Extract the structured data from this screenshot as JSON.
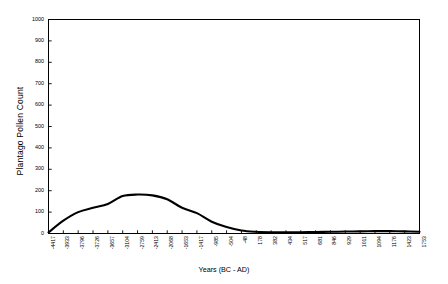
{
  "chart_data": {
    "type": "line",
    "title": "",
    "xlabel": "Years (BC - AD)",
    "ylabel": "Plantago Pollen Count",
    "ylim": [
      0,
      1000
    ],
    "ytick_labels": [
      "0",
      "100",
      "200",
      "300",
      "400",
      "500",
      "600",
      "700",
      "800",
      "900",
      "1000"
    ],
    "ytick_values": [
      0,
      100,
      200,
      300,
      400,
      500,
      600,
      700,
      800,
      900,
      1000
    ],
    "grid": false,
    "legend": null,
    "categories": [
      "-4417",
      "-3933",
      "-3796",
      "-3726",
      "-3657",
      "-3104",
      "-2759",
      "-2413",
      "-2068",
      "-1653",
      "-1417",
      "-985",
      "-504",
      "-48",
      "178",
      "382",
      "434",
      "517",
      "681",
      "846",
      "929",
      "1011",
      "1094",
      "1176",
      "1423",
      "1753"
    ],
    "values": [
      5,
      60,
      100,
      120,
      138,
      175,
      182,
      178,
      160,
      120,
      95,
      55,
      30,
      14,
      8,
      6,
      6,
      6,
      7,
      8,
      9,
      10,
      11,
      11,
      10,
      8
    ],
    "series": [
      {
        "name": "Plantago Pollen Count",
        "color": "#000000",
        "values": [
          5,
          60,
          100,
          120,
          138,
          175,
          182,
          178,
          160,
          120,
          95,
          55,
          30,
          14,
          8,
          6,
          6,
          6,
          7,
          8,
          9,
          10,
          11,
          11,
          10,
          8
        ]
      }
    ]
  },
  "axes": {
    "y_axis_title": "Plantago Pollen Count",
    "x_axis_title": "Years (BC - AD)"
  },
  "style": {
    "frame_color": "#000000",
    "line_color": "#000000",
    "background": "#ffffff"
  }
}
